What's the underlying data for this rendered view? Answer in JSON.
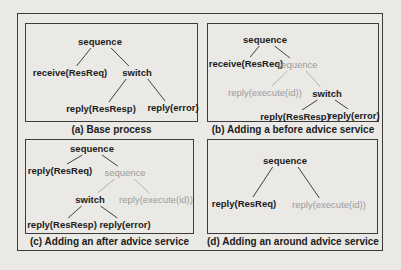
{
  "figure": {
    "background": "#eae9e5",
    "border_color": "#3c3c3c",
    "text_black": "#1c1c1c",
    "text_gray": "#9b9b9b",
    "edge_black": "#404040",
    "edge_gray": "#b0b0b0"
  },
  "panels": [
    {
      "id": "a",
      "caption": "(a) Base process",
      "nodes": [
        {
          "id": "seq",
          "label": "sequence",
          "x": 74,
          "y": 18,
          "style": "black"
        },
        {
          "id": "receive",
          "label": "receive(ResReq)",
          "x": 44,
          "y": 49,
          "style": "black"
        },
        {
          "id": "switch",
          "label": "switch",
          "x": 111,
          "y": 49,
          "style": "black"
        },
        {
          "id": "resresp",
          "label": "reply(ResResp)",
          "x": 75,
          "y": 85,
          "style": "black"
        },
        {
          "id": "error",
          "label": "reply(error)",
          "x": 147,
          "y": 84,
          "style": "black"
        }
      ],
      "edges": [
        {
          "from": "seq",
          "to": "receive",
          "style": "black"
        },
        {
          "from": "seq",
          "to": "switch",
          "style": "black"
        },
        {
          "from": "switch",
          "to": "resresp",
          "style": "black"
        },
        {
          "from": "switch",
          "to": "error",
          "style": "black"
        }
      ]
    },
    {
      "id": "b",
      "caption": "(b) Adding a before advice service",
      "nodes": [
        {
          "id": "seq1",
          "label": "sequence",
          "x": 57,
          "y": 16,
          "style": "black"
        },
        {
          "id": "receive",
          "label": "receive(ResReq)",
          "x": 38,
          "y": 40,
          "style": "black"
        },
        {
          "id": "seq2",
          "label": "sequence",
          "x": 89,
          "y": 41,
          "style": "gray"
        },
        {
          "id": "execid",
          "label": "reply(execute(id))",
          "x": 57,
          "y": 69,
          "style": "gray"
        },
        {
          "id": "switch",
          "label": "switch",
          "x": 119,
          "y": 70,
          "style": "black"
        },
        {
          "id": "resresp",
          "label": "reply(ResResp)",
          "x": 87,
          "y": 93,
          "style": "black"
        },
        {
          "id": "error",
          "label": "reply(error)",
          "x": 146,
          "y": 92,
          "style": "black"
        }
      ],
      "edges": [
        {
          "from": "seq1",
          "to": "receive",
          "style": "black"
        },
        {
          "from": "seq1",
          "to": "seq2",
          "style": "black"
        },
        {
          "from": "seq2",
          "to": "execid",
          "style": "gray"
        },
        {
          "from": "seq2",
          "to": "switch",
          "style": "gray"
        },
        {
          "from": "switch",
          "to": "resresp",
          "style": "black"
        },
        {
          "from": "switch",
          "to": "error",
          "style": "black"
        }
      ]
    },
    {
      "id": "c",
      "caption": "(c) Adding an after advice service",
      "nodes": [
        {
          "id": "seq1",
          "label": "sequence",
          "x": 66,
          "y": 9,
          "style": "black"
        },
        {
          "id": "replyreq",
          "label": "reply(ResReq)",
          "x": 34,
          "y": 31,
          "style": "black"
        },
        {
          "id": "seq2",
          "label": "sequence",
          "x": 99,
          "y": 33,
          "style": "gray"
        },
        {
          "id": "switch",
          "label": "switch",
          "x": 64,
          "y": 60,
          "style": "black"
        },
        {
          "id": "execid",
          "label": "reply(execute(id))",
          "x": 130,
          "y": 60,
          "style": "gray"
        },
        {
          "id": "resresp",
          "label": "reply(ResResp)",
          "x": 36,
          "y": 85,
          "style": "black"
        },
        {
          "id": "error",
          "label": "reply(error)",
          "x": 99,
          "y": 85,
          "style": "black"
        }
      ],
      "edges": [
        {
          "from": "seq1",
          "to": "replyreq",
          "style": "black"
        },
        {
          "from": "seq1",
          "to": "seq2",
          "style": "black"
        },
        {
          "from": "seq2",
          "to": "switch",
          "style": "gray"
        },
        {
          "from": "seq2",
          "to": "execid",
          "style": "gray"
        },
        {
          "from": "switch",
          "to": "resresp",
          "style": "black"
        },
        {
          "from": "switch",
          "to": "error",
          "style": "black"
        }
      ]
    },
    {
      "id": "d",
      "caption": "(d) Adding an around advice service",
      "nodes": [
        {
          "id": "seq",
          "label": "sequence",
          "x": 77,
          "y": 21,
          "style": "black"
        },
        {
          "id": "replyreq",
          "label": "reply(ResReq)",
          "x": 36,
          "y": 64,
          "style": "black"
        },
        {
          "id": "execid",
          "label": "reply(execute(id))",
          "x": 121,
          "y": 65,
          "style": "gray"
        }
      ],
      "edges": [
        {
          "from": "seq",
          "to": "replyreq",
          "style": "black"
        },
        {
          "from": "seq",
          "to": "execid",
          "style": "black"
        }
      ]
    }
  ]
}
